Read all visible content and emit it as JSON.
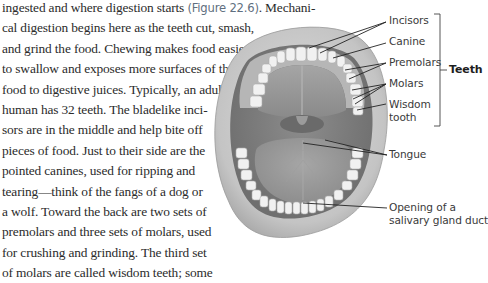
{
  "body_text": {
    "line_1_a": "ingested and where digestion starts ",
    "figure_ref": "(Figure 22.6)",
    "line_1_b": ". Mechani-",
    "lines": [
      "cal digestion begins here as the teeth cut, smash,",
      "and grind the food. Chewing makes food easier",
      "to swallow and exposes more surfaces of the",
      "food to digestive juices. Typically, an adult",
      "human has 32 teeth. The bladelike inci-",
      "sors are in the middle and help bite off",
      "pieces of food. Just to their side are the",
      "pointed canines, used for ripping and",
      "tearing—think of the fangs of a dog or",
      "a wolf. Toward the back are two sets of",
      "premolars and three sets of molars, used",
      "for crushing and grinding. The third set",
      "of molars are called wisdom teeth; some"
    ]
  },
  "figure": {
    "labels": {
      "incisors": "Incisors",
      "canine": "Canine",
      "premolars": "Premolars",
      "molars": "Molars",
      "wisdom_tooth_1": "Wisdom",
      "wisdom_tooth_2": "tooth",
      "teeth_group": "Teeth",
      "tongue": "Tongue",
      "salivary_1": "Opening of a",
      "salivary_2": "salivary gland duct"
    },
    "colors": {
      "text": "#2b2b2b",
      "figure_ref": "#5f6f80",
      "label": "#3a3a3a",
      "leader_line": "#222222",
      "lip": "#c9c9c9",
      "gum": "#b8b8b8",
      "palate": "#9e9e9e",
      "tooth": "#f2f2f2"
    }
  }
}
